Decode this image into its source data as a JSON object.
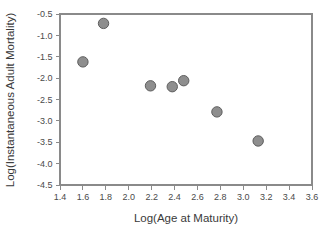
{
  "chart_data": {
    "type": "scatter",
    "title": "",
    "subtitle": "",
    "xlabel": "Log(Age at Maturity)",
    "ylabel": "Log(Instantaneous Adult Mortality)",
    "xlim": [
      1.4,
      3.6
    ],
    "ylim": [
      -4.5,
      -0.5
    ],
    "xticks": [
      1.4,
      1.6,
      1.8,
      2.0,
      2.2,
      2.4,
      2.6,
      2.8,
      3.0,
      3.2,
      3.4,
      3.6
    ],
    "xtick_labels": [
      "1.4",
      "1.6",
      "1.8",
      "2.0",
      "2.2",
      "2.4",
      "2.6",
      "2.8",
      "3.0",
      "3.2",
      "3.4",
      "3.6"
    ],
    "yticks": [
      -0.5,
      -1.0,
      -1.5,
      -2.0,
      -2.5,
      -3.0,
      -3.5,
      -4.0,
      -4.5
    ],
    "ytick_labels": [
      "-0.5",
      "-1.0",
      "-1.5",
      "-2.0",
      "-2.5",
      "-3.0",
      "-3.5",
      "-4.0",
      "-4.5"
    ],
    "grid": false,
    "legend": null,
    "series": [
      {
        "name": "observations",
        "marker": "circle",
        "marker_fill": "#8e8e8e",
        "marker_edge": "#5e5e5e",
        "marker_size": 5.2,
        "points": [
          {
            "x": 1.6,
            "y": -1.62
          },
          {
            "x": 1.78,
            "y": -0.72
          },
          {
            "x": 2.19,
            "y": -2.18
          },
          {
            "x": 2.38,
            "y": -2.2
          },
          {
            "x": 2.48,
            "y": -2.06
          },
          {
            "x": 2.77,
            "y": -2.79
          },
          {
            "x": 3.13,
            "y": -3.47
          }
        ]
      }
    ]
  },
  "colors": {
    "axis": "#8a8a8a",
    "text": "#3a3a3a",
    "tick_text": "#4a4a4a",
    "background": "#ffffff",
    "marker_fill": "#8e8e8e",
    "marker_edge": "#5e5e5e"
  }
}
